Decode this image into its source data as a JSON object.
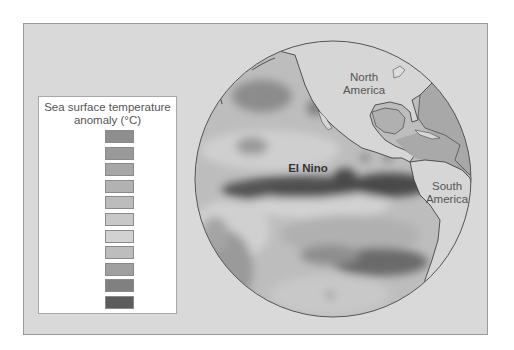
{
  "legend": {
    "title_line1": "Sea surface temperature",
    "title_line2": "anomaly (°C)",
    "items": [
      {
        "label": "−4°",
        "color": "#8e8e8e"
      },
      {
        "label": "−3°",
        "color": "#999999"
      },
      {
        "label": "−2°",
        "color": "#a6a6a6"
      },
      {
        "label": "−1°",
        "color": "#b2b2b2"
      },
      {
        "label": "0",
        "color": "#bcbcbc"
      },
      {
        "label": "+1°",
        "color": "#c8c8c8"
      },
      {
        "label": "+2°",
        "color": "#d2d2d2"
      },
      {
        "label": "+3°",
        "color": "#bdbdbd"
      },
      {
        "label": "+4°",
        "color": "#a0a0a0"
      },
      {
        "label": "+5°",
        "color": "#808080"
      },
      {
        "label": "+6°",
        "color": "#5c5c5c"
      }
    ]
  },
  "map": {
    "labels": {
      "north_america_1": "North",
      "north_america_2": "America",
      "south_america_1": "South",
      "south_america_2": "America",
      "el_nino": "El Nino"
    },
    "colors": {
      "panel_bg": "#d9d9d9",
      "land": "#d6d6d6",
      "ocean_base": "#bcbcbc",
      "el_nino_core": "#4f4f4f",
      "coastline": "#333333"
    }
  }
}
